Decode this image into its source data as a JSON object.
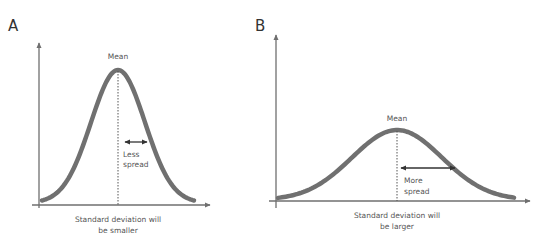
{
  "figure": {
    "colors": {
      "curve": "#707070",
      "axis": "#6f6f6f",
      "arrow": "#333333",
      "text": "#555555"
    }
  },
  "panels": [
    {
      "id": "A",
      "label": "A",
      "mean_label": "Mean",
      "spread_label_line1": "Less",
      "spread_label_line2": "spread",
      "caption_line1": "Standard deviation will",
      "caption_line2": "be smaller",
      "relative_spread": "narrow",
      "relative_peak": "tall"
    },
    {
      "id": "B",
      "label": "B",
      "mean_label": "Mean",
      "spread_label_line1": "More",
      "spread_label_line2": "spread",
      "caption_line1": "Standard deviation will",
      "caption_line2": "be larger",
      "relative_spread": "wide",
      "relative_peak": "short"
    }
  ]
}
